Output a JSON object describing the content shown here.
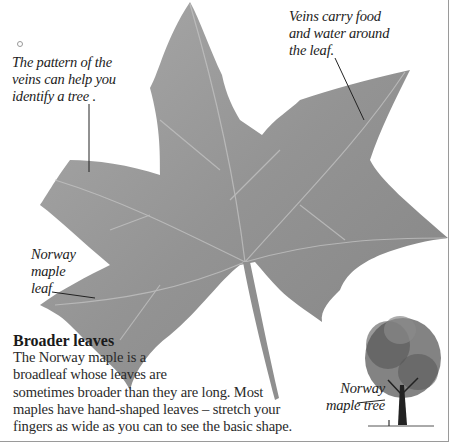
{
  "illustrations": {
    "leaf": {
      "label": "norway-maple-leaf-illustration",
      "color": "#8c8c8c"
    },
    "tree": {
      "label": "norway-maple-tree-illustration"
    }
  },
  "captions": {
    "pattern": [
      "The pattern of the",
      "veins can help you",
      "identify a tree ."
    ],
    "veins": [
      "Veins carry food",
      "and water around",
      "the leaf."
    ],
    "leaf": [
      "Norway",
      "maple",
      "leaf"
    ],
    "tree": [
      "Norway",
      "maple tree"
    ]
  },
  "section": {
    "heading": "Broader leaves",
    "body_lines": [
      "The Norway maple is a",
      "broadleaf whose leaves are",
      "sometimes broader than they are long. Most",
      "maples have hand-shaped leaves – stretch your",
      "fingers as wide as you can to see the basic shape."
    ]
  }
}
